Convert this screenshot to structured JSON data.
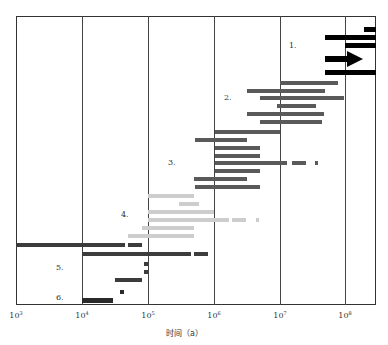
{
  "chart_data": {
    "type": "bar",
    "subtype": "horizontal-range (Gantt-like) on log time axis",
    "title": "",
    "xlabel": "时间（a）",
    "ylabel": "",
    "xscale": "log",
    "xlim": [
      1000,
      300000000
    ],
    "x_ticks": [
      {
        "label": "10",
        "exp": "3",
        "value": 1000
      },
      {
        "label": "10",
        "exp": "4",
        "value": 10000
      },
      {
        "label": "10",
        "exp": "5",
        "value": 100000
      },
      {
        "label": "10",
        "exp": "6",
        "value": 1000000
      },
      {
        "label": "10",
        "exp": "7",
        "value": 10000000
      },
      {
        "label": "10",
        "exp": "8",
        "value": 100000000
      }
    ],
    "grid": "vertical lines at each decade",
    "legend": null,
    "groups": [
      {
        "label": "1.",
        "color": "#000000",
        "bars": [
          {
            "segments": [
              [
                250000000,
                300000000
              ]
            ]
          },
          {
            "segments": [
              [
                50000000,
                300000000
              ]
            ]
          },
          {
            "segments": [
              [
                100000000,
                300000000
              ]
            ]
          },
          {
            "segments": [
              [
                50000000,
                180000000
              ]
            ],
            "arrow": true
          },
          {
            "segments": [
              [
                50000000,
                300000000
              ]
            ]
          }
        ]
      },
      {
        "label": "2.",
        "color": "#5a5a5a",
        "bars": [
          {
            "segments": [
              [
                10000000,
                75000000
              ]
            ]
          },
          {
            "segments": [
              [
                3200000,
                48000000
              ]
            ]
          },
          {
            "segments": [
              [
                5000000,
                95000000
              ]
            ]
          },
          {
            "segments": [
              [
                9000000,
                35000000
              ]
            ]
          },
          {
            "segments": [
              [
                3200000,
                46000000
              ]
            ]
          },
          {
            "segments": [
              [
                5000000,
                43000000
              ]
            ]
          }
        ]
      },
      {
        "label": "3.",
        "color": "#5a5a5a",
        "bars": [
          {
            "segments": [
              [
                1000000,
                10000000
              ]
            ]
          },
          {
            "segments": [
              [
                500000,
                3200000
              ]
            ]
          },
          {
            "segments": [
              [
                1000000,
                5000000
              ]
            ]
          },
          {
            "segments": [
              [
                1000000,
                5000000
              ]
            ]
          },
          {
            "segments": [
              [
                1000000,
                12000000
              ],
              [
                17000000,
                28000000
              ],
              [
                38000000,
                42000000
              ]
            ]
          },
          {
            "segments": [
              [
                1000000,
                5000000
              ]
            ]
          },
          {
            "segments": [
              [
                480000,
                3200000
              ]
            ]
          },
          {
            "segments": [
              [
                500000,
                5000000
              ]
            ]
          }
        ]
      },
      {
        "label": "4.",
        "color": "#cdcdcd",
        "bars": [
          {
            "segments": [
              [
                100000,
                500000
              ]
            ]
          },
          {
            "segments": [
              [
                300000,
                600000
              ]
            ]
          },
          {
            "segments": [
              [
                100000,
                1000000
              ]
            ]
          },
          {
            "segments": [
              [
                100000,
                1700000
              ],
              [
                1900000,
                3200000
              ],
              [
                4400000,
                5000000
              ]
            ]
          },
          {
            "segments": [
              [
                80000,
                500000
              ]
            ]
          },
          {
            "segments": [
              [
                50000,
                500000
              ]
            ]
          }
        ]
      },
      {
        "label": "5.",
        "color": "#3c3c3c",
        "bars": [
          {
            "segments": [
              [
                1000,
                45000
              ],
              [
                50000,
                80000
              ]
            ]
          },
          {
            "segments": [
              [
                10000,
                450000
              ],
              [
                480000,
                750000
              ]
            ]
          },
          {
            "segments": [
              [
                92000,
                100000
              ]
            ]
          },
          {
            "segments": [
              [
                92000,
                100000
              ]
            ]
          },
          {
            "segments": [
              [
                33000,
                80000
              ]
            ]
          },
          {
            "segments": [
              [
                40000,
                45000
              ]
            ]
          }
        ]
      },
      {
        "label": "6.",
        "color": "#2a2a2a",
        "bars": [
          {
            "segments": [
              [
                10000,
                30000
              ]
            ]
          }
        ]
      }
    ]
  },
  "render": {
    "plot": {
      "left": 16,
      "top": 16,
      "right": 376,
      "bottom": 305,
      "decade_px": 65.8
    },
    "gridlines_x": [
      82,
      148,
      214,
      280,
      345
    ],
    "ticks": [
      {
        "x": 16,
        "base": "10",
        "exp": "3"
      },
      {
        "x": 82,
        "base": "10",
        "exp": "4"
      },
      {
        "x": 148,
        "base": "10",
        "exp": "5"
      },
      {
        "x": 214,
        "base": "10",
        "exp": "6"
      },
      {
        "x": 280,
        "base": "10",
        "exp": "7"
      },
      {
        "x": 345,
        "base": "10",
        "exp": "8"
      }
    ],
    "group_labels": [
      {
        "text": "1.",
        "x": 289,
        "y": 46
      },
      {
        "text": "2.",
        "x": 224,
        "y": 98
      },
      {
        "text": "3.",
        "x": 168,
        "y": 163
      },
      {
        "text": "4.",
        "x": 121,
        "y": 215
      },
      {
        "text": "5.",
        "x": 56,
        "y": 268
      },
      {
        "text": "6.",
        "x": 56,
        "y": 298
      }
    ],
    "bars": [
      {
        "x1": 364,
        "x2": 376,
        "y": 27,
        "h": 5,
        "color": "#000000"
      },
      {
        "x1": 325,
        "x2": 376,
        "y": 35,
        "h": 5,
        "color": "#000000"
      },
      {
        "x1": 345,
        "x2": 376,
        "y": 43,
        "h": 5,
        "color": "#000000"
      },
      {
        "x1": 325,
        "x2": 349,
        "y": 56,
        "h": 6,
        "color": "#000000"
      },
      {
        "x1": 325,
        "x2": 376,
        "y": 70,
        "h": 5,
        "color": "#000000"
      },
      {
        "x1": 280,
        "x2": 338,
        "y": 81,
        "h": 4,
        "color": "#5a5a5a"
      },
      {
        "x1": 247,
        "x2": 325,
        "y": 89,
        "h": 4,
        "color": "#5a5a5a"
      },
      {
        "x1": 260,
        "x2": 344,
        "y": 96,
        "h": 4,
        "color": "#5a5a5a"
      },
      {
        "x1": 277,
        "x2": 316,
        "y": 104,
        "h": 4,
        "color": "#5a5a5a"
      },
      {
        "x1": 247,
        "x2": 324,
        "y": 112,
        "h": 4,
        "color": "#5a5a5a"
      },
      {
        "x1": 260,
        "x2": 322,
        "y": 120,
        "h": 4,
        "color": "#5a5a5a"
      },
      {
        "x1": 215,
        "x2": 280,
        "y": 130,
        "h": 4,
        "color": "#5a5a5a"
      },
      {
        "x1": 195,
        "x2": 247,
        "y": 138,
        "h": 4,
        "color": "#5a5a5a"
      },
      {
        "x1": 215,
        "x2": 260,
        "y": 146,
        "h": 4,
        "color": "#5a5a5a"
      },
      {
        "x1": 215,
        "x2": 260,
        "y": 154,
        "h": 4,
        "color": "#5a5a5a"
      },
      {
        "x1": 215,
        "x2": 287,
        "y": 161,
        "h": 4,
        "color": "#5a5a5a"
      },
      {
        "x1": 292,
        "x2": 306,
        "y": 161,
        "h": 4,
        "color": "#5a5a5a"
      },
      {
        "x1": 315,
        "x2": 318,
        "y": 161,
        "h": 4,
        "color": "#5a5a5a"
      },
      {
        "x1": 215,
        "x2": 260,
        "y": 169,
        "h": 4,
        "color": "#5a5a5a"
      },
      {
        "x1": 194,
        "x2": 247,
        "y": 177,
        "h": 4,
        "color": "#5a5a5a"
      },
      {
        "x1": 195,
        "x2": 260,
        "y": 185,
        "h": 4,
        "color": "#5a5a5a"
      },
      {
        "x1": 148,
        "x2": 194,
        "y": 194,
        "h": 4,
        "color": "#cdcdcd"
      },
      {
        "x1": 179,
        "x2": 199,
        "y": 202,
        "h": 4,
        "color": "#cdcdcd"
      },
      {
        "x1": 148,
        "x2": 214,
        "y": 210,
        "h": 4,
        "color": "#cdcdcd"
      },
      {
        "x1": 148,
        "x2": 229,
        "y": 218,
        "h": 4,
        "color": "#cdcdcd"
      },
      {
        "x1": 232,
        "x2": 246,
        "y": 218,
        "h": 4,
        "color": "#cdcdcd"
      },
      {
        "x1": 256,
        "x2": 259,
        "y": 218,
        "h": 4,
        "color": "#cdcdcd"
      },
      {
        "x1": 142,
        "x2": 194,
        "y": 226,
        "h": 4,
        "color": "#cdcdcd"
      },
      {
        "x1": 128,
        "x2": 194,
        "y": 234,
        "h": 4,
        "color": "#cdcdcd"
      },
      {
        "x1": 16,
        "x2": 125,
        "y": 243,
        "h": 4,
        "color": "#3c3c3c"
      },
      {
        "x1": 128,
        "x2": 142,
        "y": 243,
        "h": 4,
        "color": "#3c3c3c"
      },
      {
        "x1": 82,
        "x2": 191,
        "y": 252,
        "h": 4,
        "color": "#3c3c3c"
      },
      {
        "x1": 194,
        "x2": 208,
        "y": 252,
        "h": 4,
        "color": "#3c3c3c"
      },
      {
        "x1": 144,
        "x2": 148,
        "y": 262,
        "h": 4,
        "color": "#3c3c3c"
      },
      {
        "x1": 144,
        "x2": 148,
        "y": 270,
        "h": 4,
        "color": "#3c3c3c"
      },
      {
        "x1": 115,
        "x2": 142,
        "y": 278,
        "h": 4,
        "color": "#3c3c3c"
      },
      {
        "x1": 120,
        "x2": 124,
        "y": 290,
        "h": 4,
        "color": "#2a2a2a"
      },
      {
        "x1": 82,
        "x2": 113,
        "y": 298,
        "h": 5,
        "color": "#2a2a2a"
      }
    ],
    "arrowhead": {
      "x": 347,
      "y": 51,
      "color": "#000000"
    }
  }
}
